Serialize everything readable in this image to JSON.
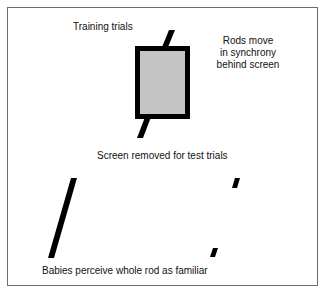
{
  "diagram": {
    "training_label": "Training trials",
    "rods_note_line1": "Rods move",
    "rods_note_line2": "in synchrony",
    "rods_note_line3": "behind screen",
    "test_label": "Screen removed for test trials",
    "conclusion_label": "Babies perceive whole rod as familiar",
    "colors": {
      "screen_fill": "#c4c4c4",
      "rod": "#000000",
      "border": "#6b6b6b"
    }
  }
}
